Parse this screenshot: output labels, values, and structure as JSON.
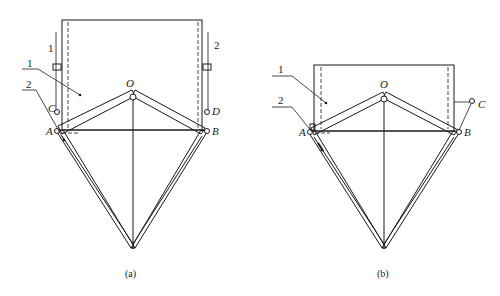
{
  "figure": {
    "panels": [
      {
        "id": "a",
        "caption": "(a)",
        "labels": {
          "part1_top_left": "1",
          "part2_top_right": "2",
          "part1_leader": "1",
          "part2_leader": "2",
          "point_O": "O",
          "point_A": "A",
          "point_B": "B",
          "point_C": "C",
          "point_D": "D"
        }
      },
      {
        "id": "b",
        "caption": "(b)",
        "labels": {
          "part1_leader": "1",
          "part2_leader": "2",
          "point_O": "O",
          "point_A": "A",
          "point_B": "B",
          "point_C": "C"
        }
      }
    ]
  }
}
